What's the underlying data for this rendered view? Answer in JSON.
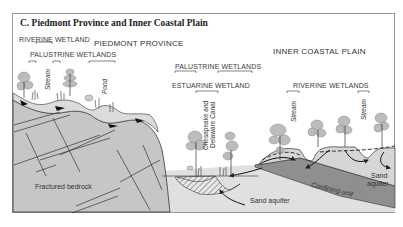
{
  "figure": {
    "title": "C.  Piedmont Province and Inner Coastal Plain",
    "regions": {
      "piedmont": "PIEDMONT PROVINCE",
      "inner_coastal_plain": "INNER COASTAL PLAIN"
    },
    "wetland_labels": {
      "riverine_wetland_left": "RIVERINE WETLAND",
      "palustrine_wetlands_left": "PALUSTRINE WETLANDS",
      "palustrine_wetlands_center": "PALUSTRINE WETLANDS",
      "estuarine_wetland": "ESTUARINE WETLAND",
      "riverine_wetlands_right": "RIVERINE WETLANDS"
    },
    "feature_labels": {
      "stream_left": "Stream",
      "pond": "Pond",
      "canal_line1": "Chesapeake and",
      "canal_line2": "Delaware Canal",
      "stream_mid": "Stream",
      "stream_right": "Stream"
    },
    "geology_labels": {
      "fractured_bedrock": "Fractured bedrock",
      "sand_aquifer_center": "Sand aquifer",
      "confining_unit": "Confining unit",
      "sand_aquifer_right_line1": "Sand",
      "sand_aquifer_right_line2": "aquifer"
    },
    "colors": {
      "bedrock": "#c4c4c4",
      "aquifer": "#e2e2e2",
      "confining": "#8e8e8e",
      "tree_foliage": "#b9b9b9",
      "line": "#333333"
    }
  }
}
